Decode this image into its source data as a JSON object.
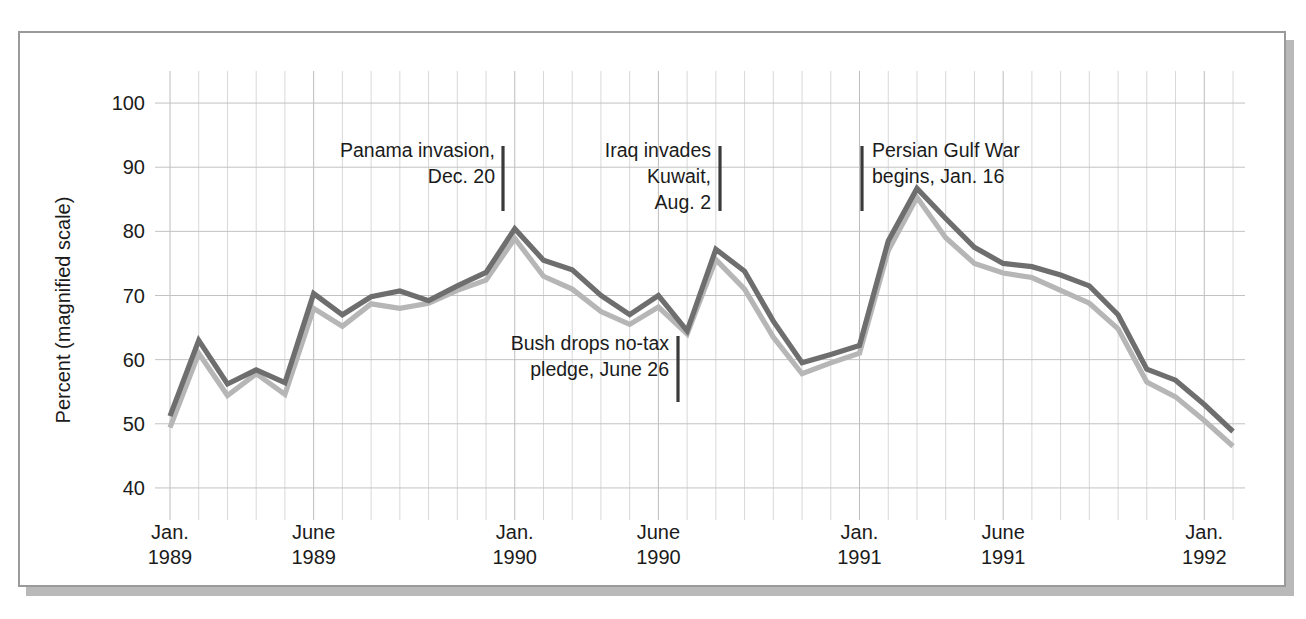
{
  "chart_data": {
    "type": "line",
    "title": "",
    "xlabel": "",
    "ylabel": "Percent (magnified scale)",
    "ylim": [
      35,
      105
    ],
    "yticks": [
      40,
      50,
      60,
      70,
      80,
      90,
      100
    ],
    "ytick_labels": [
      "40",
      "50",
      "60",
      "70",
      "80",
      "90",
      "100"
    ],
    "grid": true,
    "legend_position": "none",
    "x_major_ticks": [
      {
        "index": 0,
        "line1": "Jan.",
        "line2": "1989"
      },
      {
        "index": 5,
        "line1": "June",
        "line2": "1989"
      },
      {
        "index": 12,
        "line1": "Jan.",
        "line2": "1990"
      },
      {
        "index": 17,
        "line1": "June",
        "line2": "1990"
      },
      {
        "index": 24,
        "line1": "Jan.",
        "line2": "1991"
      },
      {
        "index": 29,
        "line1": "June",
        "line2": "1991"
      },
      {
        "index": 36,
        "line1": "Jan.",
        "line2": "1992"
      }
    ],
    "x_count": 38,
    "series": [
      {
        "name": "dark-series",
        "color": "#6e6e6e",
        "width": 5.2,
        "values": [
          51.2,
          63.0,
          56.2,
          58.4,
          56.4,
          70.3,
          67.0,
          69.8,
          70.7,
          69.2,
          71.5,
          73.6,
          80.4,
          75.5,
          74.0,
          70.0,
          67.0,
          70.0,
          64.5,
          77.2,
          73.8,
          66.0,
          59.5,
          60.8,
          62.2,
          78.5,
          86.7,
          82.0,
          77.5,
          75.0,
          74.5,
          73.2,
          71.5,
          67.0,
          58.5,
          56.8,
          53.0,
          48.8
        ]
      },
      {
        "name": "light-series",
        "color": "#b6b6b6",
        "width": 5.2,
        "values": [
          49.4,
          61.0,
          54.4,
          57.8,
          54.6,
          68.0,
          65.2,
          68.7,
          68.0,
          68.8,
          70.8,
          72.4,
          78.9,
          73.0,
          71.0,
          67.5,
          65.5,
          68.2,
          64.0,
          75.6,
          71.0,
          63.5,
          57.8,
          59.5,
          61.0,
          77.0,
          85.3,
          79.0,
          75.0,
          73.5,
          72.8,
          70.8,
          68.8,
          64.8,
          56.5,
          54.2,
          50.5,
          46.5
        ]
      }
    ],
    "annotations": [
      {
        "id": "panama",
        "lines": [
          "Panama invasion,",
          "Dec. 20"
        ],
        "align": "end",
        "text_x": 495,
        "text_y": 157,
        "marker_x": 503,
        "marker_y1": 146,
        "marker_y2": 211
      },
      {
        "id": "iraq-kuwait",
        "lines": [
          "Iraq invades",
          "Kuwait,",
          "Aug. 2"
        ],
        "align": "end",
        "text_x": 711,
        "text_y": 157,
        "marker_x": 720,
        "marker_y1": 146,
        "marker_y2": 211
      },
      {
        "id": "bush-no-tax",
        "lines": [
          "Bush drops no-tax",
          "pledge, June 26"
        ],
        "align": "end",
        "text_x": 669,
        "text_y": 350,
        "marker_x": 678,
        "marker_y1": 336,
        "marker_y2": 402
      },
      {
        "id": "persian-gulf-war",
        "lines": [
          "Persian Gulf War",
          "begins, Jan. 16"
        ],
        "align": "start",
        "text_x": 872,
        "text_y": 157,
        "marker_x": 862,
        "marker_y1": 146,
        "marker_y2": 211
      }
    ]
  },
  "figure": {
    "frame_color": "#9a9a9a",
    "background": "#ffffff"
  }
}
